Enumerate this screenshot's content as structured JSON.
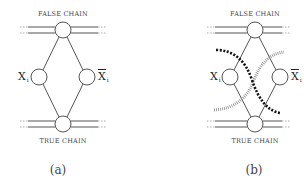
{
  "panels": [
    {
      "id": "a",
      "caption": "(a)",
      "top_label": "FALSE CHAIN",
      "bottom_label": "TRUE CHAIN",
      "left_var": {
        "symbol": "X",
        "subscript": "i",
        "negated": false
      },
      "right_var": {
        "symbol": "X",
        "subscript": "i",
        "negated": true
      },
      "curves": []
    },
    {
      "id": "b",
      "caption": "(b)",
      "top_label": "FALSE CHAIN",
      "bottom_label": "TRUE CHAIN",
      "left_var": {
        "symbol": "X",
        "subscript": "i",
        "negated": false
      },
      "right_var": {
        "symbol": "X",
        "subscript": "i",
        "negated": true
      },
      "curves": [
        {
          "style": "thick-dashed",
          "color": "#111111",
          "from": "upper-left",
          "to": "lower-right"
        },
        {
          "style": "thin-hatched",
          "color": "#888888",
          "from": "lower-left",
          "to": "upper-right"
        }
      ]
    }
  ],
  "colors": {
    "line": "#555555",
    "node_fill": "#ffffff",
    "thick_curve": "#111111",
    "hatched_curve": "#8a8a8a",
    "background": "#ffffff"
  }
}
